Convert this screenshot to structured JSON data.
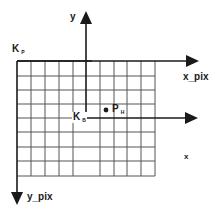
{
  "diagram": {
    "type": "coordinate-systems",
    "grid": {
      "columns": 10,
      "rows": 8,
      "left": 17,
      "top": 61,
      "cell_w": 13.8,
      "cell_h": 14.3
    },
    "labels": {
      "y_axis": "y",
      "x_axis": "x",
      "x_pix": "x_pix",
      "y_pix": "y_pix",
      "k_p_main": "K",
      "k_p_sub": "P",
      "k_b_main": "K",
      "k_b_sub": "B",
      "p_h_main": "P",
      "p_h_sub": "H"
    },
    "colors": {
      "line": "#1a1a1a",
      "grid": "#555555"
    }
  }
}
